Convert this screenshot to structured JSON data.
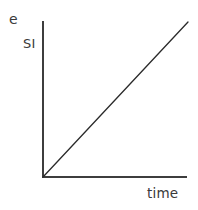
{
  "figure": {
    "background_color": "#ffffff",
    "width": 198,
    "height": 210
  },
  "labels": {
    "top_left": "e",
    "y_axis": "SI",
    "x_axis": "time"
  },
  "colors": {
    "axis": "#3d3d3d",
    "data_line": "#2a2a2a",
    "text": "#3a3a3a"
  },
  "chart_data": {
    "type": "line",
    "title": "",
    "xlabel": "time",
    "ylabel": "SI",
    "annotations": [
      "e"
    ],
    "grid": false,
    "legend": null,
    "axis_ticks": {
      "x": [],
      "y": []
    },
    "xlim": [
      0,
      1
    ],
    "ylim": [
      0,
      1
    ],
    "series": [
      {
        "name": "SI",
        "x": [
          0,
          1
        ],
        "y": [
          0,
          1
        ]
      }
    ]
  },
  "geometry": {
    "origin_x": 43,
    "origin_y": 177,
    "y_axis_top": 21,
    "x_axis_right": 187,
    "line_end_x": 188,
    "line_end_y": 22,
    "axis_width": 2,
    "data_line_width": 1.3
  }
}
